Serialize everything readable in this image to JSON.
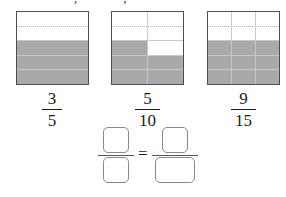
{
  "header": {
    "cut_text_fragment": "~~~~ ~~ ~~ , ~~ ~~~, ~~~"
  },
  "colors": {
    "shaded": "#a9a9a9",
    "unshaded": "#ffffff",
    "border": "#4d4d4d",
    "gridline": "#c9c9c9",
    "box_border": "#8a8a8a",
    "text": "#1a1a1a"
  },
  "models": [
    {
      "name": "three-fifths",
      "rows": 5,
      "cols": 1,
      "shaded_count": 3,
      "total_count": 5,
      "fraction": {
        "numerator": "3",
        "denominator": "5"
      },
      "cells": [
        [
          0
        ],
        [
          0
        ],
        [
          1
        ],
        [
          1
        ],
        [
          1
        ]
      ]
    },
    {
      "name": "five-tenths",
      "rows": 5,
      "cols": 2,
      "shaded_count": 5,
      "total_count": 10,
      "fraction": {
        "numerator": "5",
        "denominator": "10"
      },
      "cells": [
        [
          0,
          0
        ],
        [
          0,
          0
        ],
        [
          1,
          0
        ],
        [
          1,
          1
        ],
        [
          1,
          1
        ]
      ]
    },
    {
      "name": "nine-fifteenths",
      "rows": 5,
      "cols": 3,
      "shaded_count": 9,
      "total_count": 15,
      "fraction": {
        "numerator": "9",
        "denominator": "15"
      },
      "cells": [
        [
          0,
          0,
          0
        ],
        [
          0,
          0,
          0
        ],
        [
          1,
          1,
          1
        ],
        [
          1,
          1,
          1
        ],
        [
          1,
          1,
          1
        ]
      ]
    }
  ],
  "answer_equation": {
    "equals_sign": "=",
    "left": {
      "numerator_value": "",
      "denominator_value": "",
      "numerator_placeholder": "",
      "denominator_placeholder": ""
    },
    "right": {
      "numerator_value": "",
      "denominator_value": "",
      "numerator_placeholder": "",
      "denominator_placeholder": ""
    }
  }
}
